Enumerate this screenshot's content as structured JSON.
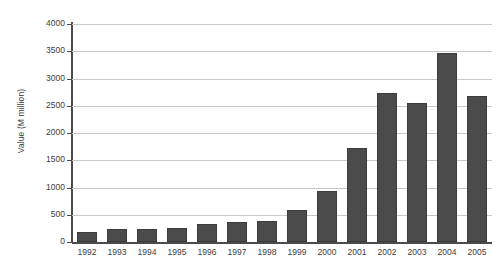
{
  "chart_data": {
    "type": "bar",
    "title": "",
    "xlabel": "",
    "ylabel": "Value (M million)",
    "categories": [
      "1992",
      "1993",
      "1994",
      "1995",
      "1996",
      "1997",
      "1998",
      "1999",
      "2000",
      "2001",
      "2002",
      "2003",
      "2004",
      "2005"
    ],
    "values": [
      175,
      230,
      235,
      265,
      330,
      375,
      380,
      590,
      940,
      1720,
      2735,
      2555,
      3460,
      2680
    ],
    "ylim": [
      0,
      4000
    ],
    "yticks": [
      0,
      500,
      1000,
      1500,
      2000,
      2500,
      3000,
      3500,
      4000
    ],
    "ytick_labels": [
      "0",
      "500",
      "1000",
      "1500",
      "2000",
      "2500",
      "3000",
      "3500",
      "4000"
    ],
    "grid": true,
    "legend": false,
    "legend_position": "none",
    "series": [
      {
        "name": "Value",
        "values": [
          175,
          230,
          235,
          265,
          330,
          375,
          380,
          590,
          940,
          1720,
          2735,
          2555,
          3460,
          2680
        ]
      }
    ],
    "colors": {
      "bar_fill": "#4b4b4b",
      "bar_border": "#3c3c3c",
      "gridline": "#c8c8c8",
      "axis": "#4a4a4a",
      "text": "#3d3d3d",
      "background": "#ffffff"
    }
  }
}
